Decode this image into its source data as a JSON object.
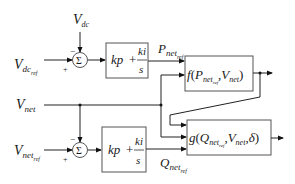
{
  "diagram": {
    "type": "control-block-diagram",
    "inputs": {
      "vdc": {
        "main": "V",
        "sub": "dc"
      },
      "vdc_ref": {
        "main": "V",
        "sub": "dc",
        "subsub": "ref"
      },
      "vnet": {
        "main": "V",
        "sub": "net"
      },
      "vnet_ref": {
        "main": "V",
        "sub": "net",
        "subsub": "ref"
      }
    },
    "summing_junctions": [
      {
        "id": "sum-top",
        "symbol": "Σ",
        "minus_sign": "−",
        "plus_sign": "+"
      },
      {
        "id": "sum-bottom",
        "symbol": "Σ",
        "minus_sign": "−",
        "plus_sign": "+"
      }
    ],
    "pi_blocks": [
      {
        "id": "pi-top",
        "kp": "kp",
        "plus": "+",
        "num": "ki",
        "den": "s"
      },
      {
        "id": "pi-bottom",
        "kp": "kp",
        "plus": "+",
        "num": "ki",
        "den": "s"
      }
    ],
    "signals": {
      "pnet_ref": {
        "main": "P",
        "sub": "net",
        "subsub": "ref"
      },
      "qnet_ref": {
        "main": "Q",
        "sub": "net",
        "subsub": "ref"
      }
    },
    "f_block": {
      "fn": "f",
      "open": "(",
      "arg1_main": "P",
      "arg1_sub": "net",
      "arg1_subsub": "ref",
      "comma": ",",
      "arg2_main": "V",
      "arg2_sub": "net",
      "close": ")"
    },
    "g_block": {
      "fn": "g",
      "open": "(",
      "arg1_main": "Q",
      "arg1_sub": "net",
      "arg1_subsub": "ref",
      "comma1": ",",
      "arg2_main": "V",
      "arg2_sub": "net",
      "comma2": ",",
      "arg3": "δ",
      "close": ")"
    }
  }
}
